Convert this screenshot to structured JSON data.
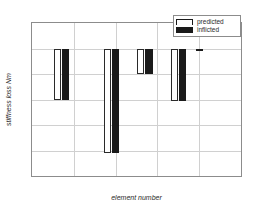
{
  "chart_data": {
    "type": "bar",
    "title": "",
    "subtitle": "",
    "xlabel": "element number",
    "ylabel": "stiffness loss Nm",
    "xlim": [
      0,
      25
    ],
    "ylim": [
      -2.5,
      0.5
    ],
    "xticks": [
      "0",
      "5",
      "10",
      "15",
      "20",
      "25"
    ],
    "xtick_values": [
      0,
      5,
      10,
      15,
      20,
      25
    ],
    "yticks": [
      "0.5",
      "0",
      "-0.5",
      "-1",
      "-1.5",
      "-2",
      "-2.5"
    ],
    "ytick_values": [
      0.5,
      0,
      -0.5,
      -1,
      -1.5,
      -2,
      -2.5
    ],
    "grid": true,
    "legend_position": "top-right",
    "legend": [
      "predicted",
      "inflicted"
    ],
    "series": [
      {
        "name": "predicted",
        "x": [
          3,
          9,
          13,
          17,
          20
        ],
        "values": [
          -1.0,
          -2.05,
          -0.5,
          -1.02,
          -0.01
        ]
      },
      {
        "name": "inflicted",
        "x": [
          4,
          10,
          14,
          18,
          20
        ],
        "values": [
          -1.0,
          -2.05,
          -0.5,
          -1.02,
          -0.01
        ]
      }
    ],
    "bars": [
      {
        "x": 3,
        "value": -1.0,
        "series": "predicted"
      },
      {
        "x": 4,
        "value": -1.0,
        "series": "inflicted"
      },
      {
        "x": 9,
        "value": -2.05,
        "series": "predicted"
      },
      {
        "x": 10,
        "value": -2.05,
        "series": "inflicted"
      },
      {
        "x": 13,
        "value": -0.5,
        "series": "predicted"
      },
      {
        "x": 14,
        "value": -0.5,
        "series": "inflicted"
      },
      {
        "x": 17,
        "value": -1.02,
        "series": "predicted"
      },
      {
        "x": 18,
        "value": -1.02,
        "series": "inflicted"
      },
      {
        "x": 20,
        "value": -0.01,
        "series": "inflicted"
      }
    ],
    "bar_width": 0.85,
    "colors": {
      "predicted": "#ffffff",
      "inflicted": "#1a1a1a",
      "axis": "#8c8c8c",
      "grid": "#d0d0d0",
      "text": "#2a2a2a",
      "background": "#ffffff"
    }
  }
}
